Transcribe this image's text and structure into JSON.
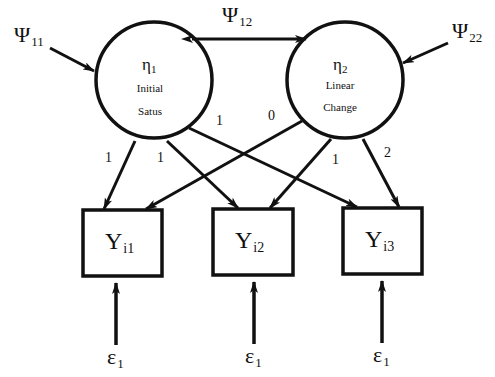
{
  "diagram": {
    "type": "latent-growth-curve-path-diagram",
    "latent_factors": [
      {
        "id": "eta1",
        "symbol": "η",
        "subscript": "1",
        "line1": "Initial",
        "line2": "Satus"
      },
      {
        "id": "eta2",
        "symbol": "η",
        "subscript": "2",
        "line1": "Linear",
        "line2": "Change"
      }
    ],
    "factor_variances": [
      {
        "symbol": "Ψ",
        "subscript": "11",
        "target": "eta1"
      },
      {
        "symbol": "Ψ",
        "subscript": "22",
        "target": "eta2"
      }
    ],
    "factor_covariance": {
      "symbol": "Ψ",
      "subscript": "12",
      "between": [
        "eta1",
        "eta2"
      ]
    },
    "observed": [
      {
        "id": "Y1",
        "symbol": "Y",
        "subscript": "i1"
      },
      {
        "id": "Y2",
        "symbol": "Y",
        "subscript": "i2"
      },
      {
        "id": "Y3",
        "symbol": "Y",
        "subscript": "i3"
      }
    ],
    "loadings": [
      {
        "from": "eta1",
        "to": "Y1",
        "label": "1"
      },
      {
        "from": "eta1",
        "to": "Y2",
        "label": "1"
      },
      {
        "from": "eta1",
        "to": "Y3",
        "label": "1"
      },
      {
        "from": "eta2",
        "to": "Y1",
        "label": "0"
      },
      {
        "from": "eta2",
        "to": "Y2",
        "label": "1"
      },
      {
        "from": "eta2",
        "to": "Y3",
        "label": "2"
      }
    ],
    "errors": [
      {
        "symbol": "ε",
        "subscript": "1",
        "target": "Y1"
      },
      {
        "symbol": "ε",
        "subscript": "1",
        "target": "Y2"
      },
      {
        "symbol": "ε",
        "subscript": "1",
        "target": "Y3"
      }
    ],
    "colors": {
      "stroke": "#111111",
      "background": "#ffffff"
    }
  }
}
